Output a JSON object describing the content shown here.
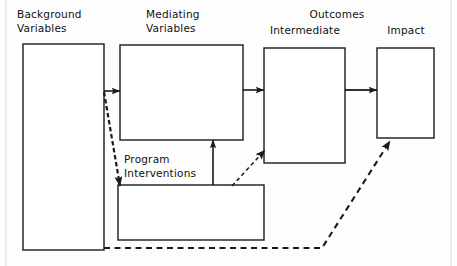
{
  "diagram": {
    "style": {
      "line_color": "#1a1a1a",
      "box_fill": "#ffffff",
      "background": "#fdfdfd",
      "text_color": "#111111"
    },
    "columns": [
      {
        "id": "background",
        "heading": "Background\nVariables"
      },
      {
        "id": "mediating",
        "heading": "Mediating\nVariables"
      },
      {
        "id": "outcomes",
        "heading": "Outcomes"
      }
    ],
    "nodes": [
      {
        "id": "background",
        "label": "Background\nVariables",
        "label_line1": "Background",
        "label_line2": "Variables",
        "x": 23,
        "y": 44,
        "w": 81,
        "h": 206
      },
      {
        "id": "mediating",
        "label": "Mediating\nVariables",
        "label_line1": "Mediating",
        "label_line2": "Variables",
        "x": 120,
        "y": 45,
        "w": 123,
        "h": 95
      },
      {
        "id": "intermediate",
        "label": "Intermediate",
        "x": 264,
        "y": 48,
        "w": 81,
        "h": 115
      },
      {
        "id": "impact",
        "label": "Impact",
        "x": 377,
        "y": 48,
        "w": 57,
        "h": 90
      },
      {
        "id": "program",
        "label": "Program\nInterventions",
        "label_line1": "Program",
        "label_line2": "Interventions",
        "x": 118,
        "y": 185,
        "w": 146,
        "h": 55
      }
    ],
    "group_headings": [
      {
        "id": "outcomes",
        "label": "Outcomes"
      }
    ],
    "edges": [
      {
        "id": "background-to-mediating",
        "from": "background",
        "to": "mediating",
        "style": "solid",
        "arrow": "single"
      },
      {
        "id": "mediating-to-intermediate",
        "from": "mediating",
        "to": "intermediate",
        "style": "solid",
        "arrow": "single"
      },
      {
        "id": "intermediate-to-impact",
        "from": "intermediate",
        "to": "impact",
        "style": "solid",
        "arrow": "single"
      },
      {
        "id": "program-to-mediating",
        "from": "program",
        "to": "mediating",
        "style": "solid",
        "arrow": "single"
      },
      {
        "id": "background-to-program",
        "from": "background",
        "to": "program",
        "style": "dashed",
        "arrow": "single"
      },
      {
        "id": "program-to-intermediate",
        "from": "program",
        "to": "intermediate",
        "style": "dashed",
        "arrow": "single"
      },
      {
        "id": "background-to-impact",
        "from": "background",
        "to": "impact",
        "style": "dashed",
        "arrow": "single"
      }
    ]
  }
}
